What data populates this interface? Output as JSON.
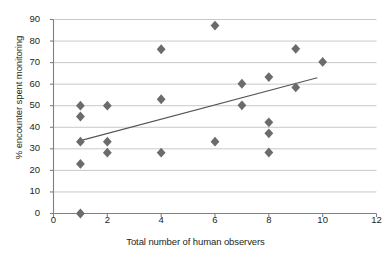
{
  "chart_data": {
    "type": "scatter",
    "title": "",
    "xlabel": "Total number of human observers",
    "ylabel": "% encounter spent monitoring",
    "xlim": [
      0,
      12
    ],
    "ylim": [
      0,
      90
    ],
    "xticks": [
      0,
      2,
      4,
      6,
      8,
      10,
      12
    ],
    "yticks": [
      0,
      10,
      20,
      30,
      40,
      50,
      60,
      70,
      80,
      90
    ],
    "grid": "horizontal",
    "legend": "none",
    "marker": "diamond",
    "marker_color": "#6b6b6b",
    "series": [
      {
        "name": "observations",
        "points": [
          {
            "x": 1,
            "y": 0
          },
          {
            "x": 1,
            "y": 23
          },
          {
            "x": 1,
            "y": 33.3
          },
          {
            "x": 1,
            "y": 45
          },
          {
            "x": 1,
            "y": 50
          },
          {
            "x": 2,
            "y": 28.2
          },
          {
            "x": 2,
            "y": 33.3
          },
          {
            "x": 2,
            "y": 50
          },
          {
            "x": 4,
            "y": 28.2
          },
          {
            "x": 4,
            "y": 53
          },
          {
            "x": 4,
            "y": 76.2
          },
          {
            "x": 6,
            "y": 33.3
          },
          {
            "x": 6,
            "y": 87.2
          },
          {
            "x": 7,
            "y": 50.2
          },
          {
            "x": 7,
            "y": 60.2
          },
          {
            "x": 8,
            "y": 28.3
          },
          {
            "x": 8,
            "y": 37.2
          },
          {
            "x": 8,
            "y": 42.3
          },
          {
            "x": 8,
            "y": 63.3
          },
          {
            "x": 9,
            "y": 58.5
          },
          {
            "x": 9,
            "y": 76.4
          },
          {
            "x": 10,
            "y": 70.3
          }
        ]
      }
    ],
    "trendline": {
      "name": "linear-fit",
      "color": "#555555",
      "x_start": 1,
      "y_start": 33.8,
      "x_end": 9.8,
      "y_end": 63.0
    },
    "colors": {
      "axis": "#808080",
      "gridline": "#c9c9c9",
      "text": "#231f20"
    }
  }
}
